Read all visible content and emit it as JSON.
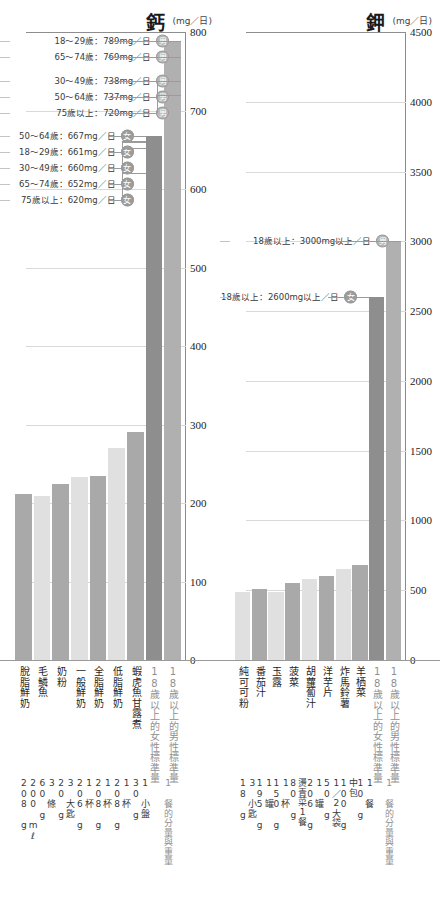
{
  "charts": [
    {
      "id": "calcium",
      "nutrient": "鈣",
      "unit": "(mg／日)",
      "ticks": [
        "800",
        "700",
        "600",
        "500",
        "400",
        "300",
        "200",
        "100",
        "0"
      ],
      "tick_values": [
        800,
        700,
        600,
        500,
        400,
        300,
        200,
        100,
        0
      ],
      "ymax": 800,
      "annotations": [
        {
          "text": "18～29歲：789mg／日",
          "badge": "男",
          "sex": "male",
          "value": 789
        },
        {
          "text": "65～74歲：769mg／日",
          "badge": "男",
          "sex": "male",
          "value": 769
        },
        {
          "text": "30～49歲：738mg／日",
          "badge": "男",
          "sex": "male",
          "value": 738
        },
        {
          "text": "50～64歲：737mg／日",
          "badge": "男",
          "sex": "male",
          "value": 737
        },
        {
          "text": "75歲以上：720mg／日",
          "badge": "男",
          "sex": "male",
          "value": 720
        },
        {
          "text": "50～64歲：667mg／日",
          "badge": "女",
          "sex": "female",
          "value": 667
        },
        {
          "text": "18～29歲：661mg／日",
          "badge": "女",
          "sex": "female",
          "value": 661
        },
        {
          "text": "30～49歲：660mg／日",
          "badge": "女",
          "sex": "female",
          "value": 660
        },
        {
          "text": "65～74歲：652mg／日",
          "badge": "女",
          "sex": "female",
          "value": 652
        },
        {
          "text": "75歲以上：620mg／日",
          "badge": "女",
          "sex": "female",
          "value": 620
        }
      ],
      "items": [
        {
          "label": "脫脂鮮奶",
          "value": 212,
          "serving": "200 mℓ\n208 g",
          "shade": "dark"
        },
        {
          "label": "毛鱗魚",
          "value": 209,
          "serving": "3 條\n60 g",
          "shade": "light"
        },
        {
          "label": "奶粉",
          "value": 224,
          "serving": "3 大匙\n20 g",
          "shade": "dark"
        },
        {
          "label": "一般鮮奶",
          "value": 233,
          "serving": "1 杯\n206 g",
          "shade": "light"
        },
        {
          "label": "全脂鮮奶",
          "value": 235,
          "serving": "1 杯\n208 g",
          "shade": "dark"
        },
        {
          "label": "低脂鮮奶",
          "value": 270,
          "serving": "1 杯\n208 g",
          "shade": "light"
        },
        {
          "label": "蝦虎魚甘露煮",
          "value": 291,
          "serving": "1 小盤\n30 g",
          "shade": "dark"
        }
      ],
      "reference_bars": [
        {
          "label": "18歲以上的女性標準量",
          "value": 667,
          "shade": "ref-dark"
        },
        {
          "label": "18歲以上的男性標準量",
          "value": 789,
          "shade": "ref-light"
        }
      ],
      "serving_note": "1 餐的分量與重量"
    },
    {
      "id": "potassium",
      "nutrient": "鉀",
      "unit": "(mg／日)",
      "ticks": [
        "4500",
        "4000",
        "3500",
        "3000",
        "2500",
        "2000",
        "1500",
        "1000",
        "500",
        "0"
      ],
      "tick_values": [
        4500,
        4000,
        3500,
        3000,
        2500,
        2000,
        1500,
        1000,
        500,
        0
      ],
      "ymax": 4500,
      "annotations": [
        {
          "text": "18歲以上：3000mg以上／日",
          "badge": "男",
          "sex": "male",
          "value": 3000
        },
        {
          "text": "18歲以上：2600mg以上／日",
          "badge": "女",
          "sex": "female",
          "value": 2600
        }
      ],
      "items": [
        {
          "label": "純可可粉",
          "value": 486,
          "serving": "3 小匙\n18 g",
          "shade": "light"
        },
        {
          "label": "番茄汁",
          "value": 507,
          "serving": "1 罐\n195 g",
          "shade": "dark"
        },
        {
          "label": "玉露",
          "value": 488,
          "serving": "1 杯\n150 g",
          "shade": "light"
        },
        {
          "label": "菠菜",
          "value": 553,
          "serving": "燙青菜1餐\n80 g",
          "shade": "dark"
        },
        {
          "label": "胡蘿蔔汁",
          "value": 577,
          "serving": "1 罐\n206 g",
          "shade": "light"
        },
        {
          "label": "洋芋片",
          "value": 600,
          "serving": "1／2大袋\n50 g",
          "shade": "dark"
        },
        {
          "label": "炸馬鈴薯",
          "value": 650,
          "serving": "中包\n100 g",
          "shade": "light"
        },
        {
          "label": "羊栖菜",
          "value": 680,
          "serving": "1 餐\n10 g",
          "shade": "dark"
        }
      ],
      "reference_bars": [
        {
          "label": "18歲以上的女性標準量",
          "value": 2600,
          "shade": "ref-dark"
        },
        {
          "label": "18歲以上的男性標準量",
          "value": 3000,
          "shade": "ref-light"
        }
      ],
      "serving_note": "1 餐的分量與重量"
    }
  ],
  "colors": {
    "bar_dark": "#a9a9a9",
    "bar_light": "#e0e0e0",
    "ref_dark": "#8e8e8e",
    "ref_light": "#b0b0b0",
    "gridline": "#d9d9d9",
    "axis": "#8a8a8a",
    "text": "#333333",
    "muted": "#8f8f8f"
  },
  "chart_data": {
    "type": "bar",
    "panels": [
      {
        "title": "鈣",
        "ylabel": "(mg／日)",
        "ylim": [
          0,
          800
        ],
        "yticks": [
          0,
          100,
          200,
          300,
          400,
          500,
          600,
          700,
          800
        ],
        "categories": [
          "脫脂鮮奶",
          "毛鱗魚",
          "奶粉",
          "一般鮮奶",
          "全脂鮮奶",
          "低脂鮮奶",
          "蝦虎魚甘露煮",
          "18歲以上的女性標準量",
          "18歲以上的男性標準量"
        ],
        "values": [
          212,
          209,
          224,
          233,
          235,
          270,
          291,
          667,
          789
        ],
        "reference_lines": [
          {
            "label": "18～29歲：789mg／日",
            "value": 789,
            "sex": "男"
          },
          {
            "label": "65～74歲：769mg／日",
            "value": 769,
            "sex": "男"
          },
          {
            "label": "30～49歲：738mg／日",
            "value": 738,
            "sex": "男"
          },
          {
            "label": "50～64歲：737mg／日",
            "value": 737,
            "sex": "男"
          },
          {
            "label": "75歲以上：720mg／日",
            "value": 720,
            "sex": "男"
          },
          {
            "label": "50～64歲：667mg／日",
            "value": 667,
            "sex": "女"
          },
          {
            "label": "18～29歲：661mg／日",
            "value": 661,
            "sex": "女"
          },
          {
            "label": "30～49歲：660mg／日",
            "value": 660,
            "sex": "女"
          },
          {
            "label": "65～74歲：652mg／日",
            "value": 652,
            "sex": "女"
          },
          {
            "label": "75歲以上：620mg／日",
            "value": 620,
            "sex": "女"
          }
        ]
      },
      {
        "title": "鉀",
        "ylabel": "(mg／日)",
        "ylim": [
          0,
          4500
        ],
        "yticks": [
          0,
          500,
          1000,
          1500,
          2000,
          2500,
          3000,
          3500,
          4000,
          4500
        ],
        "categories": [
          "純可可粉",
          "番茄汁",
          "玉露",
          "菠菜",
          "胡蘿蔔汁",
          "洋芋片",
          "炸馬鈴薯",
          "羊栖菜",
          "18歲以上的女性標準量",
          "18歲以上的男性標準量"
        ],
        "values": [
          486,
          507,
          488,
          553,
          577,
          600,
          650,
          680,
          2600,
          3000
        ],
        "reference_lines": [
          {
            "label": "18歲以上：3000mg以上／日",
            "value": 3000,
            "sex": "男"
          },
          {
            "label": "18歲以上：2600mg以上／日",
            "value": 2600,
            "sex": "女"
          }
        ]
      }
    ],
    "grid": true,
    "legend": "none"
  }
}
